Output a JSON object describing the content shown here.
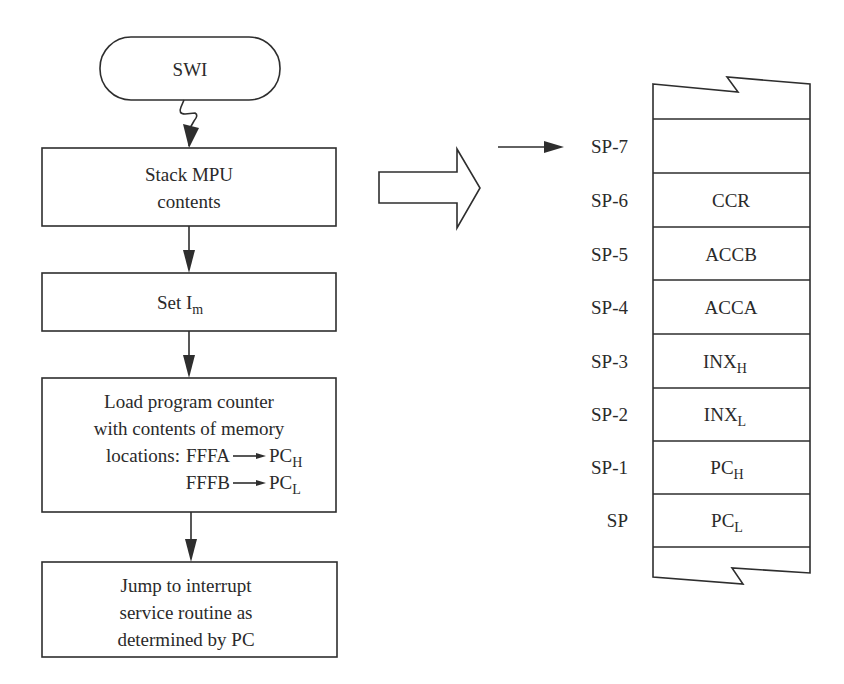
{
  "diagram": {
    "type": "flowchart-with-stack",
    "colors": {
      "ink": "#2e2e2e",
      "text": "#2a2a2a",
      "background": "#ffffff"
    },
    "flowchart": {
      "start": {
        "label": "SWI"
      },
      "steps": [
        {
          "lines": [
            "Stack MPU",
            "contents"
          ]
        },
        {
          "label": "Set I",
          "subscript": "m"
        },
        {
          "lines": [
            "Load program counter",
            "with contents of memory"
          ],
          "mappings": [
            {
              "prefix": "locations:",
              "from": "FFFA",
              "to": "PC",
              "to_sub": "H"
            },
            {
              "prefix": "",
              "from": "FFFB",
              "to": "PC",
              "to_sub": "L"
            }
          ]
        },
        {
          "lines": [
            "Jump to interrupt",
            "service routine as",
            "determined by PC"
          ]
        }
      ]
    },
    "transition_arrow": {
      "shape": "block-arrow-right"
    },
    "stack": {
      "pointer_arrow": "right-arrow",
      "rows": [
        {
          "address": "SP-7",
          "content": "",
          "sub": ""
        },
        {
          "address": "SP-6",
          "content": "CCR",
          "sub": ""
        },
        {
          "address": "SP-5",
          "content": "ACCB",
          "sub": ""
        },
        {
          "address": "SP-4",
          "content": "ACCA",
          "sub": ""
        },
        {
          "address": "SP-3",
          "content": "INX",
          "sub": "H"
        },
        {
          "address": "SP-2",
          "content": "INX",
          "sub": "L"
        },
        {
          "address": "SP-1",
          "content": "PC",
          "sub": "H"
        },
        {
          "address": "SP",
          "content": "PC",
          "sub": "L"
        }
      ]
    }
  }
}
